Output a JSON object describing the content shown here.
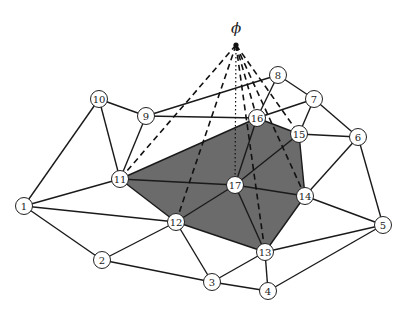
{
  "diagram": {
    "type": "planar-graph-with-apex",
    "apex": {
      "label": "ϕ",
      "x": 236,
      "y": 45,
      "label_x": 236,
      "label_y": 33
    },
    "colors": {
      "shade": "#6b6b6b",
      "edge": "#1a1a1a",
      "node_fill": "#ffffff"
    },
    "nodes": [
      {
        "id": "1",
        "x": 24,
        "y": 206
      },
      {
        "id": "2",
        "x": 102,
        "y": 260
      },
      {
        "id": "3",
        "x": 212,
        "y": 282
      },
      {
        "id": "4",
        "x": 268,
        "y": 291
      },
      {
        "id": "5",
        "x": 383,
        "y": 225
      },
      {
        "id": "6",
        "x": 358,
        "y": 137
      },
      {
        "id": "7",
        "x": 314,
        "y": 99
      },
      {
        "id": "8",
        "x": 278,
        "y": 75
      },
      {
        "id": "9",
        "x": 146,
        "y": 116
      },
      {
        "id": "10",
        "x": 99,
        "y": 99
      },
      {
        "id": "11",
        "x": 120,
        "y": 179
      },
      {
        "id": "12",
        "x": 176,
        "y": 222
      },
      {
        "id": "13",
        "x": 265,
        "y": 252
      },
      {
        "id": "14",
        "x": 305,
        "y": 196
      },
      {
        "id": "15",
        "x": 299,
        "y": 134
      },
      {
        "id": "16",
        "x": 257,
        "y": 118
      },
      {
        "id": "17",
        "x": 235,
        "y": 185
      }
    ],
    "shaded_region": [
      "11",
      "16",
      "15",
      "14",
      "13",
      "12"
    ],
    "edges": [
      [
        "1",
        "10"
      ],
      [
        "1",
        "11"
      ],
      [
        "1",
        "12"
      ],
      [
        "1",
        "2"
      ],
      [
        "10",
        "9"
      ],
      [
        "10",
        "11"
      ],
      [
        "9",
        "11"
      ],
      [
        "9",
        "8"
      ],
      [
        "9",
        "16"
      ],
      [
        "8",
        "16"
      ],
      [
        "8",
        "7"
      ],
      [
        "16",
        "7"
      ],
      [
        "16",
        "15"
      ],
      [
        "7",
        "15"
      ],
      [
        "7",
        "6"
      ],
      [
        "15",
        "6"
      ],
      [
        "6",
        "14"
      ],
      [
        "6",
        "5"
      ],
      [
        "15",
        "14"
      ],
      [
        "14",
        "5"
      ],
      [
        "14",
        "13"
      ],
      [
        "13",
        "5"
      ],
      [
        "13",
        "4"
      ],
      [
        "4",
        "5"
      ],
      [
        "13",
        "3"
      ],
      [
        "3",
        "4"
      ],
      [
        "2",
        "3"
      ],
      [
        "2",
        "12"
      ],
      [
        "12",
        "3"
      ],
      [
        "12",
        "13"
      ],
      [
        "11",
        "12"
      ],
      [
        "11",
        "16"
      ],
      [
        "11",
        "17"
      ],
      [
        "17",
        "16"
      ],
      [
        "17",
        "15"
      ],
      [
        "17",
        "14"
      ],
      [
        "17",
        "13"
      ],
      [
        "17",
        "12"
      ]
    ],
    "apex_dashed_edges": [
      "11",
      "12",
      "13",
      "14",
      "15",
      "16"
    ],
    "apex_dotted_edges": [
      "17"
    ]
  }
}
